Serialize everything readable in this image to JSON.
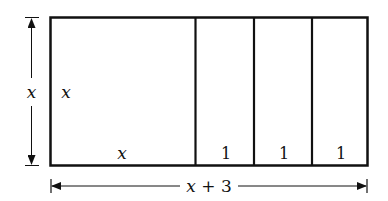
{
  "diagram": {
    "outer_rect": {
      "width_label": "x + 3",
      "height_label": "x"
    },
    "square": {
      "side_label_left": "x",
      "side_label_bottom": "x"
    },
    "strips": [
      {
        "label": "1"
      },
      {
        "label": "1"
      },
      {
        "label": "1"
      }
    ],
    "dimension_vertical": {
      "label": "x"
    },
    "dimension_horizontal": {
      "label": "x + 3"
    },
    "colors": {
      "stroke": "#111111",
      "background": "#ffffff"
    }
  }
}
